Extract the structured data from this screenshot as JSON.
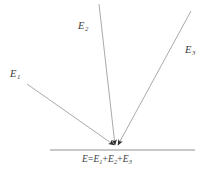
{
  "figure": {
    "type": "vector-superposition-diagram",
    "background_color": "#ffffff",
    "line_color": "#9a9a9a",
    "baseline_color": "#8f8f8f",
    "arrow_color": "#2f2f2f",
    "text_color": "#3c3c3c",
    "width": 214,
    "height": 181
  },
  "baseline": {
    "name": "horizontal-surface-line",
    "x_start": 50,
    "x_end": 195,
    "y": 150
  },
  "convergence_point": {
    "x": 116,
    "y": 146
  },
  "rays": [
    {
      "id": "E1",
      "label_base": "E",
      "label_sub": "1",
      "x_start": 27,
      "y_start": 84,
      "x_end": 114,
      "y_end": 145,
      "label_x": 10,
      "label_y": 69
    },
    {
      "id": "E2",
      "label_base": "E",
      "label_sub": "2",
      "x_start": 99,
      "y_start": 4,
      "x_end": 115,
      "y_end": 145,
      "label_x": 78,
      "label_y": 21
    },
    {
      "id": "E3",
      "label_base": "E",
      "label_sub": "3",
      "x_start": 191,
      "y_start": 11,
      "x_end": 118,
      "y_end": 145,
      "label_x": 185,
      "label_y": 45
    }
  ],
  "caption": {
    "full_text": "E=E1+E2+E3",
    "lhs": "E",
    "equals": "=",
    "term1_base": "E",
    "term1_sub": "1",
    "plus1": "+",
    "term2_base": "E",
    "term2_sub": "2",
    "plus2": "+",
    "term3_base": "E",
    "term3_sub": "3"
  }
}
